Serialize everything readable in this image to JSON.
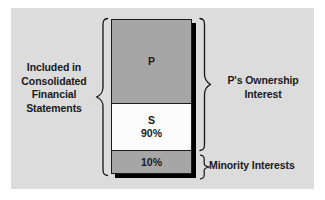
{
  "figure": {
    "background_color": "#dcdcdc",
    "page_color": "#ffffff",
    "line_color": "#141414"
  },
  "left_label": {
    "name": "included-in-consolidated-financial-statements",
    "lines": [
      "Included in",
      "Consolidated",
      "Financial",
      "Statements"
    ]
  },
  "stack": {
    "segments": [
      {
        "id": "parent",
        "label": "P",
        "sub_label": "",
        "fill": "#a6a6a6",
        "share": ""
      },
      {
        "id": "subsidiary-majority",
        "label": "S",
        "sub_label": "90%",
        "fill": "#ffffff",
        "share": "90%"
      },
      {
        "id": "subsidiary-minority",
        "label": "10%",
        "sub_label": "",
        "fill": "#a6a6a6",
        "share": "10%"
      }
    ]
  },
  "right_labels": {
    "ownership": {
      "name": "p-ownership-interest",
      "lines": [
        "P's Ownership",
        "Interest"
      ]
    },
    "minority": {
      "name": "minority-interests",
      "lines": [
        "Minority Interests"
      ]
    }
  },
  "braces": {
    "left": "left-curly-brace",
    "right_top": "right-curly-brace-ownership",
    "right_bottom": "right-curly-brace-minority"
  }
}
